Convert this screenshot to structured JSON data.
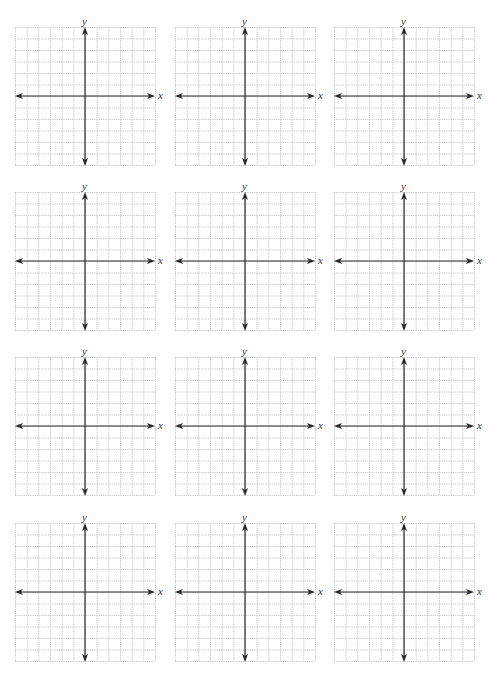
{
  "page": {
    "top_text_fragment": "",
    "background": "#ffffff"
  },
  "grid_style": {
    "cells_x": 12,
    "cells_y": 12,
    "axis_index_x": 6,
    "axis_index_y": 6,
    "grid_color": "#b8b8b8",
    "axis_color": "#2a2a2a"
  },
  "graphs": [
    {
      "id": "graph-1",
      "row": 1,
      "col": 1,
      "x_label": "x",
      "y_label": "y"
    },
    {
      "id": "graph-2",
      "row": 1,
      "col": 2,
      "x_label": "x",
      "y_label": "y"
    },
    {
      "id": "graph-3",
      "row": 1,
      "col": 3,
      "x_label": "x",
      "y_label": "y"
    },
    {
      "id": "graph-4",
      "row": 2,
      "col": 1,
      "x_label": "x",
      "y_label": "y"
    },
    {
      "id": "graph-5",
      "row": 2,
      "col": 2,
      "x_label": "x",
      "y_label": "y"
    },
    {
      "id": "graph-6",
      "row": 2,
      "col": 3,
      "x_label": "x",
      "y_label": "y"
    },
    {
      "id": "graph-7",
      "row": 3,
      "col": 1,
      "x_label": "x",
      "y_label": "y"
    },
    {
      "id": "graph-8",
      "row": 3,
      "col": 2,
      "x_label": "x",
      "y_label": "y"
    },
    {
      "id": "graph-9",
      "row": 3,
      "col": 3,
      "x_label": "x",
      "y_label": "y"
    },
    {
      "id": "graph-10",
      "row": 4,
      "col": 1,
      "x_label": "x",
      "y_label": "y"
    },
    {
      "id": "graph-11",
      "row": 4,
      "col": 2,
      "x_label": "x",
      "y_label": "y"
    },
    {
      "id": "graph-12",
      "row": 4,
      "col": 3,
      "x_label": "x",
      "y_label": "y"
    }
  ]
}
